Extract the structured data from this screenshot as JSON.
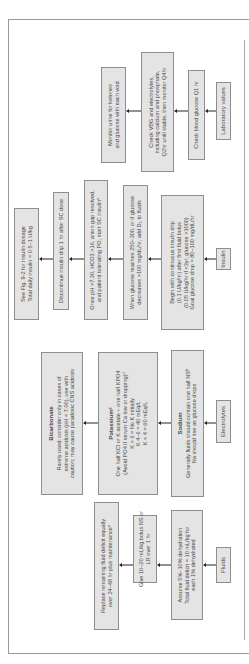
{
  "colors": {
    "box_fill": "#e4e4e4",
    "box_border": "#8e8e8e",
    "text": "#4a4a4a",
    "arrow": "#222222"
  },
  "rows": {
    "fluids": {
      "label": "Fluids",
      "steps": [
        {
          "lines": [
            "Assume 5%–10% dehydration",
            "Total fluid deficit = 10 mL/kg for",
            "each 1% dehydrated"
          ]
        },
        {
          "lines": [
            "Give 10–20 mL/kg bolus NS or",
            "LR over 1 hr"
          ]
        },
        {
          "lines": [
            "Replace remaining fluid deficit equally",
            "over 24–48 hr plus maintenanceᵃ"
          ]
        }
      ]
    },
    "electrolytes": {
      "label": "Electrolytes",
      "steps": [
        {
          "heading": "Sodium",
          "lines": [
            "Generally fluids should contain one half NSᵇ",
            "Na should rise as glucose drops"
          ]
        },
        {
          "heading": "Potassiumᶜ",
          "lines": [
            "One half KCl or K acetate + one half KPO4",
            "(Avoid PO4 if serum Ca low or dropping)ᵈ",
            "K > 6 = No K initially",
            "K 4–6 = 40 mEq/L",
            "K < 4 = 60 mEq/L"
          ]
        },
        {
          "heading": "Bicarbonate",
          "lines": [
            "Rarely used; consider only in cases of",
            "extreme acidosis (pH < 7.00), use with",
            "caution; may cause paradoxic CNS acidosis"
          ]
        }
      ]
    },
    "insulin": {
      "label": "Insulin",
      "steps": [
        {
          "lines": [
            "Begin with continuous insulin drip",
            "(0.1 U/kg/hr) after first fluid bolus",
            "(0.05 U/kg/hr if <3yr, glucose >1000)",
            "Goal glucose drop = 80–100 mg/dL/hr"
          ]
        },
        {
          "lines": [
            "When glucose reaches 250–300, or if glucose",
            "decreases >100 mg/dL/hr, add D₅ to fluids"
          ]
        },
        {
          "lines": [
            "Once pH >7.30, HCO3 >16, anion gap resolved,",
            "and patient tolerating PO, start SC insulinᵉ"
          ]
        },
        {
          "lines": [
            "Discontinue insulin drip 1 hr after SC dose"
          ]
        },
        {
          "lines": [
            "See Fig. 9-2 for insulin dosage",
            "Total daily insulin = 0.5–1 U/kg"
          ]
        }
      ]
    },
    "lab": {
      "label": "Laboratory values",
      "steps": [
        {
          "lines": [
            "Check blood glucose Q1 hr"
          ]
        },
        {
          "lines": [
            "Check VBG and electrolytes,",
            "including calcium and phosphate,",
            "Q2hr until stable, then monitor Q4hr"
          ]
        },
        {
          "lines": [
            "Monitor urine for ketones",
            "and glucose with each void"
          ]
        }
      ]
    }
  }
}
